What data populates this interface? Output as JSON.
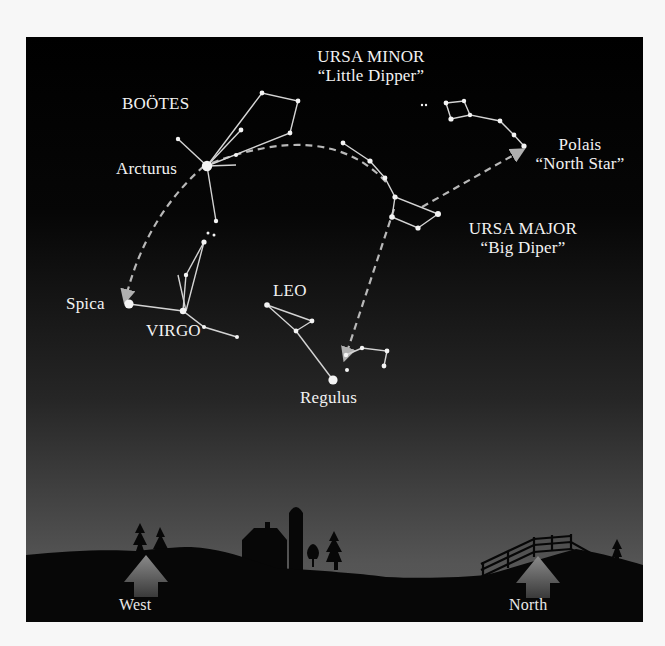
{
  "figure": {
    "background": "#f7f7f7",
    "sky_gradient": [
      "#000000",
      "#050505",
      "#2a2a2a",
      "#585858"
    ],
    "ground_color": "#080808",
    "star_color": "#f4f4f4",
    "line_color": "#d8d8d8",
    "pointer_color": "#b8b8b8"
  },
  "constellations": {
    "bootes": {
      "name": "BOÖTES",
      "bright_star": "Arcturus"
    },
    "ursa_minor": {
      "name": "URSA MINOR",
      "nickname": "“Little Dipper”"
    },
    "polaris": {
      "name": "Polais",
      "nickname": "“North Star”"
    },
    "ursa_major": {
      "name": "URSA MAJOR",
      "nickname": "“Big Diper”"
    },
    "leo": {
      "name": "LEO",
      "bright_star": "Regulus"
    },
    "virgo": {
      "name": "VIRGO",
      "bright_star": "Spica"
    }
  },
  "directions": {
    "west": "West",
    "north": "North"
  }
}
